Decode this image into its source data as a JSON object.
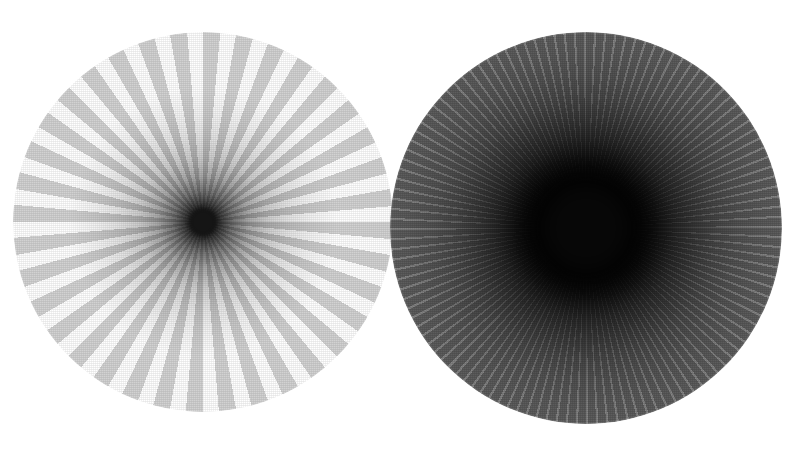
{
  "image": {
    "title": "Radial spoke test patterns",
    "width": 792,
    "height": 450,
    "background_color": "#ffffff",
    "panel_count": 2
  },
  "chart_data": {
    "type": "scatter",
    "subtitle": "Two radial sinusoid / spoke targets of differing spoke count and contrast",
    "xlabel": "",
    "ylabel": "",
    "grid": false,
    "legend_position": "none",
    "annotations": [],
    "panels": [
      {
        "name": "left-pattern",
        "label": "Coarse low-contrast radial spoke target",
        "spoke_count": 36,
        "duty_cycle": 0.52,
        "center_x": 203,
        "center_y": 222,
        "radius": 190,
        "spoke_color": "#d2d2d2",
        "gap_color": "#ffffff",
        "core_color": "#151515",
        "core_radius": 14,
        "falloff_start_pct": 5,
        "falloff_end_pct": 46,
        "rim_gray_hex": "#d2d2d2",
        "mid_gray_hex": "#b9b9b9"
      },
      {
        "name": "right-pattern",
        "label": "Fine high-contrast radial spoke target",
        "spoke_count": 120,
        "duty_cycle": 0.78,
        "center_x": 586,
        "center_y": 228,
        "radius": 196,
        "spoke_color": "#6b6b6b",
        "gap_color": "#8f8f8f",
        "core_color": "#080808",
        "core_radius": 46,
        "falloff_start_pct": 19,
        "falloff_end_pct": 62,
        "rim_gray_hex": "#6b6b6b",
        "mid_gray_hex": "#4a4a4a"
      }
    ]
  },
  "panels": {
    "left": {
      "name": "left-pattern",
      "caption": "",
      "css": {
        "left": "13px",
        "top": "32px",
        "size": "380px",
        "spokes": "repeating-conic-gradient(from 0deg at 50% 50%, #d2d2d2 0deg, #d2d2d2 5.2deg, #ffffff 5.2deg, #ffffff 10deg)",
        "shade": "radial-gradient(circle at 50% 50%, rgba(0,0,0,0.97) 0%, rgba(0,0,0,0.95) 3.4%, rgba(0,0,0,0.80) 6%, rgba(0,0,0,0.55) 11%, rgba(0,0,0,0.34) 17%, rgba(0,0,0,0.20) 24%, rgba(0,0,0,0.11) 32%, rgba(0,0,0,0.05) 40%, rgba(0,0,0,0.00) 50%)",
        "core_size": "27px",
        "core_color": "#151515",
        "core_blur": "2.2px",
        "grain_opacity": "0.13"
      }
    },
    "right": {
      "name": "right-pattern",
      "caption": "",
      "css": {
        "left": "390px",
        "top": "32px",
        "size": "392px",
        "spokes": "repeating-conic-gradient(from 0deg at 50% 50%, #636363 0deg, #636363 2.34deg, #8d8d8d 2.34deg, #8d8d8d 3.0deg)",
        "shade": "radial-gradient(circle at 50% 50%, rgba(0,0,0,1.00) 0%, rgba(0,0,0,1.00) 16%, rgba(0,0,0,0.94) 21%, rgba(0,0,0,0.80) 27%, rgba(0,0,0,0.62) 33%, rgba(0,0,0,0.45) 40%, rgba(0,0,0,0.30) 47%, rgba(0,0,0,0.18) 55%, rgba(0,0,0,0.09) 64%, rgba(0,0,0,0.03) 74%, rgba(0,0,0,0.00) 86%)",
        "core_size": "92px",
        "core_color": "#070707",
        "core_blur": "11px",
        "grain_opacity": "0.20"
      }
    }
  }
}
